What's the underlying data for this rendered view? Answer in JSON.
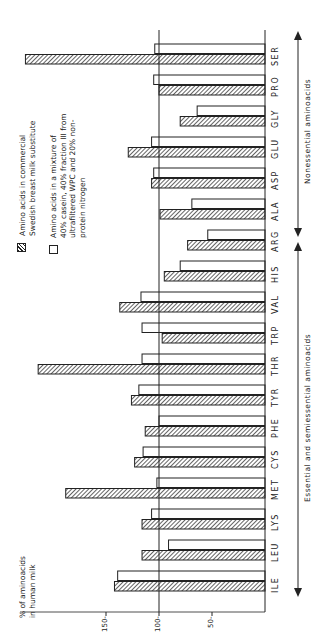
{
  "chart_data": {
    "type": "bar",
    "orientation": "horizontal (figure rotated 90° counter-clockwise; value axis runs leftward from baseline)",
    "ylabel": "% of aminoacids in human milk",
    "categories": [
      "ILE",
      "LEU",
      "LYS",
      "MET",
      "CYS",
      "PHE",
      "TYR",
      "THR",
      "TRP",
      "VAL",
      "HIS",
      "ARG",
      "ALA",
      "ASP",
      "GLU",
      "GLY",
      "PRO",
      "SER"
    ],
    "series": [
      {
        "name": "Amino acids in commercial Swedish breast milk substitute",
        "style": "hatched",
        "values": [
          142,
          116,
          116,
          188,
          123,
          113,
          126,
          214,
          97,
          137,
          95,
          73,
          99,
          107,
          129,
          80,
          100,
          226
        ]
      },
      {
        "name": "Amino acids in a mixture of 40% casein, 40% fraction III from ultrafiltered WPC and 20% non-protein nitrogen",
        "style": "open",
        "values": [
          139,
          91,
          107,
          102,
          115,
          100,
          119,
          116,
          116,
          117,
          80,
          54,
          69,
          105,
          107,
          64,
          105,
          104
        ]
      }
    ],
    "yticks": [
      50,
      100,
      150
    ],
    "reference_line": 100,
    "ylim": [
      0,
      230
    ],
    "groups": [
      {
        "label": "Essential and semiessential aminoacids",
        "categories": [
          "ILE",
          "LEU",
          "LYS",
          "MET",
          "CYS",
          "PHE",
          "TYR",
          "THR",
          "TRP",
          "VAL",
          "HIS",
          "ARG"
        ]
      },
      {
        "label": "Nonessential aminoacids",
        "categories": [
          "ALA",
          "ASP",
          "GLU",
          "GLY",
          "PRO",
          "SER"
        ]
      }
    ],
    "legend_position": "upper-left (rotated)"
  },
  "labels": {
    "ylabel_line1": "% of aminoacids",
    "ylabel_line2": "in human milk",
    "legend1_line1": "Amino acids in commercial",
    "legend1_line2": "Swedish breast milk substitute",
    "legend2_line1": "Amino acids in a mixture of",
    "legend2_line2": "40% casein, 40% fraction III from",
    "legend2_line3": "ultrafiltered WPC and 20% non-",
    "legend2_line4": "protein nitrogen",
    "group_essential": "Essential and semiessential aminoacids",
    "group_nonessential": "Nonessential aminoacids",
    "tick_150": "150-",
    "tick_100": "100-",
    "tick_50": "50-"
  }
}
